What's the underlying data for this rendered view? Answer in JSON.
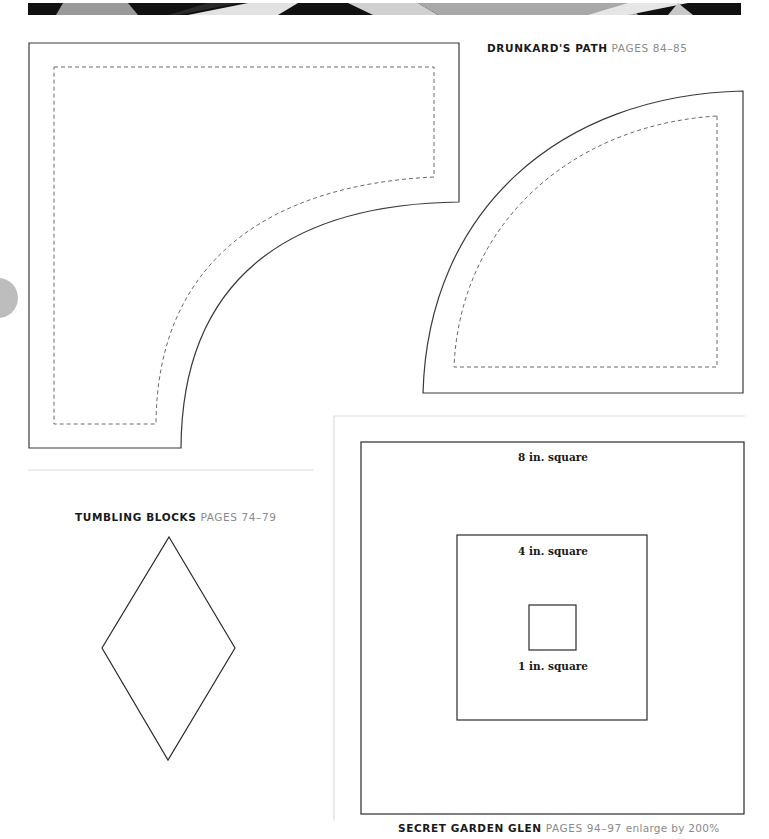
{
  "banner": {
    "description": "decorative quilt-fabric strip",
    "colors": [
      "#111111",
      "#9a9a9a",
      "#141414",
      "#d8d8d8",
      "#1a1a1a",
      "#bcbcbc",
      "#0f0f0f"
    ]
  },
  "page_tab": {
    "icon": "page-number-circle",
    "color": "#bdbdbd"
  },
  "templates": {
    "drunkards_path": {
      "name": "DRUNKARD'S PATH",
      "pages": "PAGES 84–85"
    },
    "tumbling_blocks": {
      "name": "TUMBLING BLOCKS",
      "pages": "PAGES 74–79"
    },
    "secret_garden_glen": {
      "name": "SECRET GARDEN GLEN",
      "pages": "PAGES 94–97",
      "note": "enlarge by 200%",
      "squares": [
        {
          "label": "8 in. square"
        },
        {
          "label": "4 in. square"
        },
        {
          "label": "1 in. square"
        }
      ]
    }
  },
  "colors": {
    "cut_line": "#3a3a3a",
    "seam_line": "#6a6a6a",
    "divider": "#dcdcdc",
    "caption_name": "#1a1a1a",
    "caption_pages": "#8a8a8a"
  }
}
